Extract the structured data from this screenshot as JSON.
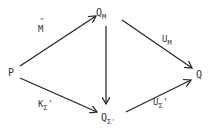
{
  "diagram": {
    "type": "commutative-diagram",
    "stroke_color": "#222222",
    "text_color": "#333333",
    "nodes": {
      "P": {
        "label": "P",
        "sub": ""
      },
      "QM": {
        "label": "Q",
        "sub": "M"
      },
      "Q": {
        "label": "Q",
        "sub": ""
      },
      "QS": {
        "label": "Q",
        "sub": "Σ'"
      }
    },
    "edges": {
      "P_QM": {
        "from": "P",
        "to": "Q_M",
        "label": "M",
        "accent": "^"
      },
      "QM_Q": {
        "from": "Q_M",
        "to": "Q",
        "label": "U",
        "sub": "M"
      },
      "QM_QS": {
        "from": "Q_M",
        "to": "Q_Σ'",
        "label": ""
      },
      "P_QS": {
        "from": "P",
        "to": "Q_Σ'",
        "label": "K",
        "sub": "Σ",
        "prime": "'"
      },
      "QS_Q": {
        "from": "Q_Σ'",
        "to": "Q",
        "label": "U",
        "sub": "Σ",
        "prime": "'"
      }
    }
  }
}
